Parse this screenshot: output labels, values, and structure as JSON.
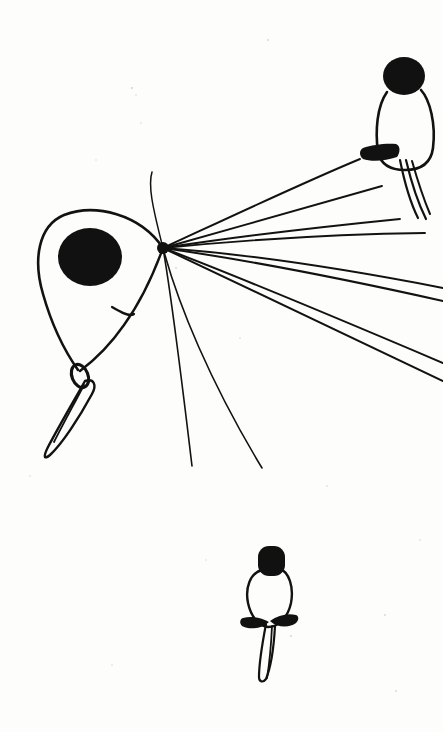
{
  "artwork": {
    "title": "Ink line drawing of three perched birds with radiating lines",
    "medium": "black ink on off-white paper",
    "canvas": {
      "width": 443,
      "height": 732
    },
    "background_color": "#fdfdfb",
    "ink_color": "#111111",
    "speck_color": "#d8d6d0"
  },
  "figures": [
    {
      "id": "large-bird",
      "label": "Large foreground bird, left of center",
      "head": {
        "type": "filled-circle",
        "cx": 90,
        "cy": 257,
        "rx": 32,
        "ry": 29
      },
      "body_outline": "M 163 248 C 140 214 95 203 64 215 C 38 226 33 260 43 294 C 52 326 64 350 78 370",
      "body_outline_lower": "M 163 248 C 155 270 142 300 124 325 C 108 348 92 362 80 371",
      "wing_hint": "M 112 307 C 122 313 130 317 134 314",
      "eye_ring": {
        "cx": 80,
        "cy": 376,
        "rx": 8,
        "ry": 12,
        "rotate": -22
      },
      "tail_outline": "M 85 381 C 72 404 58 428 48 447 C 43 457 44 460 50 455 C 62 444 79 418 92 394 C 97 385 94 378 85 381 Z",
      "tail_inner": "M 84 385 C 73 406 62 426 54 442"
    },
    {
      "id": "upper-right-bird",
      "label": "Small bird perched at top right",
      "head": {
        "type": "filled-ellipse",
        "cx": 404,
        "cy": 76,
        "rx": 21,
        "ry": 19
      },
      "body_outline": "M 387 92 C 377 106 375 131 378 152 C 381 166 392 170 405 170 C 421 170 431 163 433 148 C 436 124 430 100 421 90",
      "perch_blob": "M 363 148 C 372 145 385 143 396 144 C 401 146 400 153 397 157 C 386 161 371 162 363 159 C 359 156 359 150 363 148 Z",
      "tail_strokes": [
        "M 400 160 C 404 180 410 202 418 218",
        "M 406 160 C 411 181 418 203 426 219",
        "M 412 161 C 418 182 424 200 430 214"
      ]
    },
    {
      "id": "lower-bird",
      "label": "Small bird near bottom center",
      "head": {
        "type": "filled-rounded",
        "x": 258,
        "y": 546,
        "w": 27,
        "h": 30,
        "r": 11
      },
      "body_outline": "M 262 570 C 250 573 245 588 248 603 C 251 617 259 626 268 627 C 279 627 288 617 291 603 C 294 587 289 572 280 569",
      "wing_left": "M 243 618 C 251 616 261 617 269 622 C 262 629 249 630 242 626 C 239 623 240 619 243 618 Z",
      "wing_right": "M 296 615 C 288 613 278 615 270 621 C 277 628 290 628 296 623 C 299 620 299 616 296 615 Z",
      "tail_outline": "M 266 624 C 262 645 259 665 259 677 C 259 682 263 683 266 679 C 271 667 274 644 275 626",
      "tail_inner": "M 272 626 C 271 648 269 666 267 678"
    }
  ],
  "radiating_lines": {
    "label": "Fan of ink lines radiating from a single convergence point",
    "origin": {
      "x": 163,
      "y": 248
    },
    "count": 11,
    "strokes": [
      {
        "id": "ray-1",
        "path": "M 163 248 C 228 218 300 184 360 159",
        "width": 1.9
      },
      {
        "id": "ray-2",
        "path": "M 163 248 C 235 228 320 203 382 186",
        "width": 1.9
      },
      {
        "id": "ray-3",
        "path": "M 163 248 C 240 236 330 226 400 219",
        "width": 1.9
      },
      {
        "id": "ray-4",
        "path": "M 163 248 C 245 240 340 234 425 233",
        "width": 1.9
      },
      {
        "id": "ray-5",
        "path": "M 163 248 C 248 254 340 268 443 288",
        "width": 2.0
      },
      {
        "id": "ray-6",
        "path": "M 163 248 C 248 260 340 278 443 301",
        "width": 2.0
      },
      {
        "id": "ray-7",
        "path": "M 163 248 C 240 277 330 315 443 363",
        "width": 2.0
      },
      {
        "id": "ray-8",
        "path": "M 163 248 C 238 284 325 325 443 381",
        "width": 2.0
      },
      {
        "id": "ray-9",
        "path": "M 163 248 C 178 304 210 382 262 468",
        "width": 1.6
      },
      {
        "id": "ray-10",
        "path": "M 163 248 C 172 300 182 382 192 466",
        "width": 1.6
      },
      {
        "id": "ray-11",
        "path": "M 163 248 C 152 205 148 185 152 172",
        "width": 1.5
      }
    ]
  },
  "paper_specks": [
    {
      "cx": 132,
      "cy": 88,
      "r": 1.1
    },
    {
      "cx": 136,
      "cy": 95,
      "r": 0.8
    },
    {
      "cx": 268,
      "cy": 40,
      "r": 0.9
    },
    {
      "cx": 141,
      "cy": 123,
      "r": 0.8
    },
    {
      "cx": 96,
      "cy": 160,
      "r": 0.7
    },
    {
      "cx": 240,
      "cy": 338,
      "r": 0.8
    },
    {
      "cx": 176,
      "cy": 268,
      "r": 0.9
    },
    {
      "cx": 327,
      "cy": 486,
      "r": 0.8
    },
    {
      "cx": 291,
      "cy": 636,
      "r": 1.0
    },
    {
      "cx": 385,
      "cy": 615,
      "r": 0.9
    },
    {
      "cx": 30,
      "cy": 476,
      "r": 0.8
    },
    {
      "cx": 206,
      "cy": 560,
      "r": 0.7
    },
    {
      "cx": 420,
      "cy": 540,
      "r": 0.8
    },
    {
      "cx": 112,
      "cy": 665,
      "r": 0.8
    },
    {
      "cx": 396,
      "cy": 691,
      "r": 0.9
    }
  ]
}
